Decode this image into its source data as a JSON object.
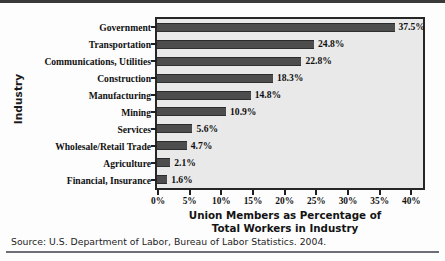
{
  "chart_data": {
    "type": "bar",
    "orientation": "horizontal",
    "title": "",
    "xlabel_line1": "Union Members as Percentage of",
    "xlabel_line2": "Total Workers in Industry",
    "ylabel": "Industry",
    "categories": [
      "Government",
      "Transportation",
      "Communications, Utilities",
      "Construction",
      "Manufacturing",
      "Mining",
      "Services",
      "Wholesale/Retail Trade",
      "Agriculture",
      "Financial, Insurance"
    ],
    "values": [
      37.5,
      24.8,
      22.8,
      18.3,
      14.8,
      10.9,
      5.6,
      4.7,
      2.1,
      1.6
    ],
    "value_labels": [
      "37.5%",
      "24.8%",
      "22.8%",
      "18.3%",
      "14.8%",
      "10.9%",
      "5.6%",
      "4.7%",
      "2.1%",
      "1.6%"
    ],
    "xlim": [
      0,
      42
    ],
    "xticks": [
      0,
      5,
      10,
      15,
      20,
      25,
      30,
      35,
      40
    ],
    "xtick_labels": [
      "0%",
      "5%",
      "10%",
      "15%",
      "20%",
      "25%",
      "30%",
      "35%",
      "40%"
    ],
    "grid": false,
    "legend": "none",
    "bar_color": "#4d4d4d",
    "plot_background": "#e9e9e9",
    "axis_color": "#262626"
  },
  "source": {
    "text": "Source: U.S. Department of Labor, Bureau of Labor Statistics. 2004."
  }
}
